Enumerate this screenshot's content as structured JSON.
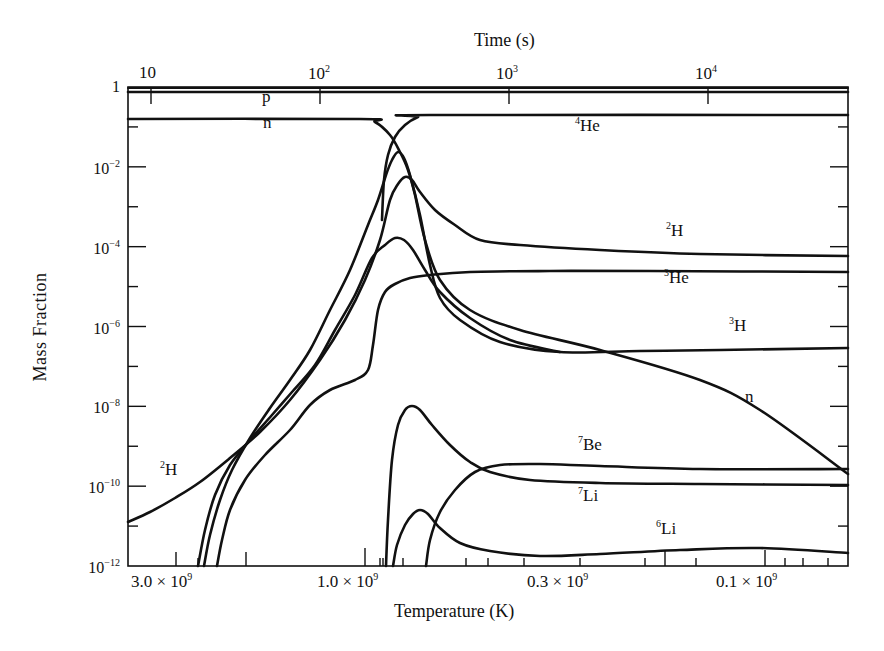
{
  "chart_data": {
    "type": "line",
    "title": "",
    "xlabel": "Temperature (K)",
    "x2label": "Time (s)",
    "ylabel": "Mass Fraction",
    "yscale": "log",
    "ylim": [
      1e-12,
      1
    ],
    "grid": false,
    "legend": "inline labels",
    "y_ticks": [
      {
        "base": "1",
        "exp": "",
        "value": 1
      },
      {
        "base": "10",
        "exp": "−2",
        "value": 0.01
      },
      {
        "base": "10",
        "exp": "−4",
        "value": 0.0001
      },
      {
        "base": "10",
        "exp": "−6",
        "value": 1e-06
      },
      {
        "base": "10",
        "exp": "−8",
        "value": 1e-08
      },
      {
        "base": "10",
        "exp": "−10",
        "value": 1e-10
      },
      {
        "base": "10",
        "exp": "−12",
        "value": 1e-12
      }
    ],
    "x_bottom_ticks": [
      {
        "label": "3.0 × 10",
        "exp": "9",
        "value": 3000000000.0
      },
      {
        "label": "1.0 × 10",
        "exp": "9",
        "value": 1000000000.0
      },
      {
        "label": "0.3 × 10",
        "exp": "9",
        "value": 300000000.0
      },
      {
        "label": "0.1 × 10",
        "exp": "9",
        "value": 100000000.0
      }
    ],
    "x_top_ticks": [
      {
        "label": "10",
        "exp": "",
        "value": 10
      },
      {
        "label": "10",
        "exp": "2",
        "value": 100
      },
      {
        "label": "10",
        "exp": "3",
        "value": 1000
      },
      {
        "label": "10",
        "exp": "4",
        "value": 10000
      }
    ],
    "series": [
      {
        "name": "p",
        "label": "p",
        "sup": "",
        "points": [
          [
            128,
            92
          ],
          [
            848,
            92
          ]
        ]
      },
      {
        "name": "n",
        "label": "n",
        "sup": "",
        "points": [
          [
            128,
            119
          ],
          [
            360,
            119
          ],
          [
            375,
            122
          ],
          [
            390,
            135
          ],
          [
            400,
            152
          ],
          [
            408,
            170
          ],
          [
            415,
            195
          ],
          [
            425,
            240
          ],
          [
            440,
            280
          ],
          [
            470,
            310
          ],
          [
            520,
            330
          ],
          [
            600,
            350
          ],
          [
            700,
            380
          ],
          [
            760,
            410
          ],
          [
            848,
            474
          ]
        ]
      },
      {
        "name": "4He",
        "label": "He",
        "sup": "4",
        "points": [
          [
            382,
            220
          ],
          [
            384,
            180
          ],
          [
            388,
            155
          ],
          [
            395,
            137
          ],
          [
            405,
            125
          ],
          [
            418,
            117
          ],
          [
            430,
            115
          ],
          [
            848,
            115
          ]
        ]
      },
      {
        "name": "2H",
        "label": "H",
        "sup": "2",
        "points": [
          [
            128,
            522
          ],
          [
            150,
            512
          ],
          [
            175,
            498
          ],
          [
            200,
            482
          ],
          [
            230,
            458
          ],
          [
            260,
            432
          ],
          [
            290,
            400
          ],
          [
            320,
            360
          ],
          [
            345,
            320
          ],
          [
            365,
            280
          ],
          [
            380,
            240
          ],
          [
            390,
            200
          ],
          [
            398,
            184
          ],
          [
            405,
            177
          ],
          [
            412,
            180
          ],
          [
            420,
            192
          ],
          [
            435,
            210
          ],
          [
            455,
            225
          ],
          [
            480,
            240
          ],
          [
            520,
            245
          ],
          [
            600,
            250
          ],
          [
            700,
            254
          ],
          [
            848,
            256
          ]
        ]
      },
      {
        "name": "3H",
        "label": "H",
        "sup": "3",
        "points": [
          [
            204,
            566
          ],
          [
            210,
            535
          ],
          [
            220,
            500
          ],
          [
            232,
            470
          ],
          [
            250,
            438
          ],
          [
            270,
            408
          ],
          [
            290,
            380
          ],
          [
            310,
            350
          ],
          [
            330,
            310
          ],
          [
            350,
            270
          ],
          [
            368,
            225
          ],
          [
            378,
            200
          ],
          [
            386,
            175
          ],
          [
            392,
            160
          ],
          [
            398,
            152
          ],
          [
            404,
            158
          ],
          [
            410,
            175
          ],
          [
            420,
            215
          ],
          [
            430,
            265
          ],
          [
            440,
            298
          ],
          [
            460,
            320
          ],
          [
            500,
            342
          ],
          [
            560,
            352
          ],
          [
            640,
            351
          ],
          [
            720,
            350
          ],
          [
            848,
            348
          ]
        ]
      },
      {
        "name": "3He",
        "label": "He",
        "sup": "3",
        "points": [
          [
            217,
            566
          ],
          [
            222,
            540
          ],
          [
            230,
            510
          ],
          [
            245,
            480
          ],
          [
            265,
            455
          ],
          [
            290,
            430
          ],
          [
            310,
            405
          ],
          [
            330,
            390
          ],
          [
            355,
            380
          ],
          [
            368,
            370
          ],
          [
            373,
            345
          ],
          [
            378,
            310
          ],
          [
            385,
            292
          ],
          [
            395,
            284
          ],
          [
            410,
            278
          ],
          [
            430,
            275
          ],
          [
            470,
            272
          ],
          [
            550,
            271
          ],
          [
            650,
            271
          ],
          [
            848,
            272
          ]
        ]
      },
      {
        "name": "3He-early",
        "label": "",
        "sup": "",
        "points": [
          [
            198,
            566
          ],
          [
            205,
            530
          ],
          [
            215,
            495
          ],
          [
            230,
            465
          ],
          [
            250,
            440
          ],
          [
            272,
            415
          ],
          [
            292,
            392
          ],
          [
            315,
            365
          ],
          [
            335,
            330
          ],
          [
            355,
            295
          ],
          [
            372,
            258
          ],
          [
            385,
            245
          ],
          [
            395,
            238
          ],
          [
            404,
            240
          ],
          [
            413,
            250
          ],
          [
            425,
            270
          ],
          [
            440,
            292
          ],
          [
            470,
            318
          ],
          [
            510,
            340
          ],
          [
            560,
            352
          ]
        ]
      },
      {
        "name": "7Be",
        "label": "Be",
        "sup": "7",
        "points": [
          [
            386,
            566
          ],
          [
            388,
            520
          ],
          [
            392,
            460
          ],
          [
            398,
            425
          ],
          [
            405,
            410
          ],
          [
            412,
            406
          ],
          [
            420,
            410
          ],
          [
            432,
            425
          ],
          [
            450,
            445
          ],
          [
            470,
            462
          ],
          [
            490,
            472
          ],
          [
            530,
            480
          ],
          [
            600,
            483
          ],
          [
            700,
            484
          ],
          [
            848,
            485
          ]
        ]
      },
      {
        "name": "7Li",
        "label": "Li",
        "sup": "7",
        "points": [
          [
            426,
            566
          ],
          [
            430,
            540
          ],
          [
            440,
            512
          ],
          [
            455,
            490
          ],
          [
            475,
            472
          ],
          [
            500,
            465
          ],
          [
            540,
            464
          ],
          [
            600,
            466
          ],
          [
            700,
            469
          ],
          [
            848,
            469
          ]
        ]
      },
      {
        "name": "6Li",
        "label": "Li",
        "sup": "6",
        "points": [
          [
            393,
            566
          ],
          [
            397,
            545
          ],
          [
            405,
            525
          ],
          [
            413,
            514
          ],
          [
            420,
            510
          ],
          [
            428,
            514
          ],
          [
            440,
            528
          ],
          [
            460,
            543
          ],
          [
            490,
            551
          ],
          [
            540,
            556
          ],
          [
            600,
            554
          ],
          [
            680,
            550
          ],
          [
            760,
            548
          ],
          [
            848,
            553
          ]
        ]
      }
    ],
    "annotations": [
      {
        "text": "p",
        "x": 262,
        "y": 96
      },
      {
        "text": "n",
        "x": 263,
        "y": 122
      },
      {
        "text": "He",
        "sup": "4",
        "x": 575,
        "y": 124
      },
      {
        "text": "H",
        "sup": "2",
        "x": 666,
        "y": 229
      },
      {
        "text": "He",
        "sup": "3",
        "x": 664,
        "y": 276
      },
      {
        "text": "H",
        "sup": "3",
        "x": 729,
        "y": 324
      },
      {
        "text": "n",
        "x": 745,
        "y": 396
      },
      {
        "text": "Be",
        "sup": "7",
        "x": 578,
        "y": 443
      },
      {
        "text": "Li",
        "sup": "7",
        "x": 578,
        "y": 494
      },
      {
        "text": "Li",
        "sup": "6",
        "x": 656,
        "y": 527
      },
      {
        "text": "H",
        "sup": "2",
        "x": 160,
        "y": 468
      }
    ]
  },
  "labels": {
    "xlabel": "Temperature (K)",
    "x2label": "Time (s)",
    "ylabel": "Mass Fraction"
  }
}
